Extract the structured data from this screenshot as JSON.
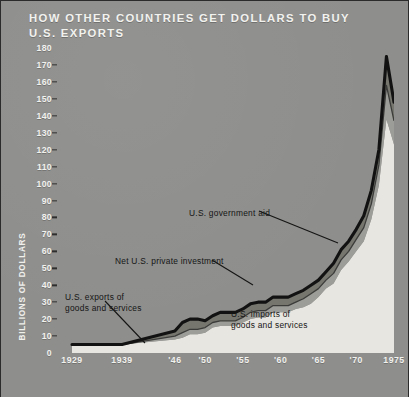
{
  "chart_title": {
    "line1": "HOW OTHER COUNTRIES GET DOLLARS TO BUY",
    "line2": "U.S. EXPORTS"
  },
  "colors": {
    "background": "#8e8e8c",
    "title_text": "#f2f2ef",
    "axis_line": "#2b2b2b",
    "exports_line": "#141414",
    "gov_aid_band": "#7a7a78",
    "private_band": "#9c9c99",
    "imports_fill": "#e8e6e0",
    "annotation_text": "#151515"
  },
  "axes": {
    "y_title": "BILLIONS OF DOLLARS",
    "y_ticks": [
      0,
      10,
      20,
      30,
      40,
      50,
      60,
      70,
      80,
      90,
      100,
      110,
      120,
      130,
      140,
      150,
      160,
      170,
      180
    ],
    "x_ticks": [
      "1929",
      "1939",
      "'46",
      "'50",
      "'55",
      "'60",
      "'65",
      "'70",
      "1975"
    ]
  },
  "annotations": {
    "gov_aid": "U.S. government aid",
    "private_investment": "Net U.S. private investment",
    "exports_line1": "U.S. exports of",
    "exports_line2": "goods  and  services",
    "imports_line1": "U.S. imports of",
    "imports_line2": "goods  and  services"
  },
  "chart_data": {
    "type": "area",
    "title": "HOW OTHER COUNTRIES GET DOLLARS TO BUY U.S. EXPORTS",
    "xlabel": "",
    "ylabel": "BILLIONS OF DOLLARS",
    "ylim": [
      0,
      180
    ],
    "grid": false,
    "legend": "annotations-inline",
    "x": [
      1929,
      1939,
      1946,
      1947,
      1948,
      1949,
      1950,
      1951,
      1952,
      1953,
      1954,
      1955,
      1956,
      1957,
      1958,
      1959,
      1960,
      1961,
      1962,
      1963,
      1964,
      1965,
      1966,
      1967,
      1968,
      1969,
      1970,
      1971,
      1972,
      1973,
      1974,
      1975
    ],
    "x_tick_labels": [
      "1929",
      "1939",
      "'46",
      "'50",
      "'55",
      "'60",
      "'65",
      "'70",
      "1975"
    ],
    "series": [
      {
        "name": "U.S. imports of goods and services",
        "stacked_order": 1,
        "values": [
          5,
          5,
          8,
          9,
          11,
          11,
          12,
          15,
          16,
          16,
          16,
          18,
          20,
          21,
          21,
          24,
          24,
          24,
          26,
          27,
          29,
          33,
          38,
          41,
          49,
          54,
          60,
          66,
          79,
          99,
          138,
          123
        ]
      },
      {
        "name": "Net U.S. private investment",
        "stacked_order": 2,
        "values": [
          0,
          0,
          2,
          3,
          3,
          3,
          3,
          3,
          3,
          3,
          3,
          3,
          4,
          4,
          4,
          4,
          4,
          4,
          4,
          5,
          6,
          5,
          5,
          6,
          6,
          6,
          7,
          8,
          9,
          12,
          20,
          14
        ]
      },
      {
        "name": "U.S. government aid",
        "stacked_order": 3,
        "values": [
          0,
          0,
          3,
          6,
          6,
          6,
          4,
          4,
          5,
          5,
          5,
          5,
          5,
          5,
          5,
          5,
          5,
          5,
          5,
          5,
          5,
          5,
          5,
          6,
          6,
          6,
          6,
          7,
          8,
          9,
          17,
          11
        ]
      }
    ],
    "total_top_line": {
      "name": "U.S. exports of goods and services",
      "values": [
        5,
        5,
        13,
        18,
        20,
        20,
        19,
        22,
        24,
        24,
        24,
        26,
        29,
        30,
        30,
        33,
        33,
        33,
        35,
        37,
        40,
        43,
        48,
        53,
        61,
        66,
        73,
        81,
        96,
        120,
        175,
        148
      ]
    }
  }
}
